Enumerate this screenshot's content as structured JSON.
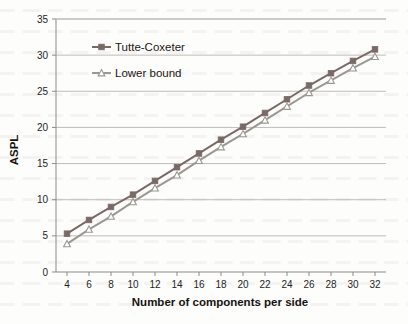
{
  "chart_data": {
    "type": "line",
    "title": "",
    "xlabel": "Number of components per side",
    "ylabel": "ASPL",
    "x": [
      4,
      6,
      8,
      10,
      12,
      14,
      16,
      18,
      20,
      22,
      24,
      26,
      28,
      30,
      32
    ],
    "xlim": [
      3,
      33
    ],
    "ylim": [
      0,
      35
    ],
    "xticks": [
      4,
      6,
      8,
      10,
      12,
      14,
      16,
      18,
      20,
      22,
      24,
      26,
      28,
      30,
      32
    ],
    "yticks": [
      0,
      5,
      10,
      15,
      20,
      25,
      30,
      35
    ],
    "grid": "horizontal",
    "legend_position": "upper-left-inside",
    "series": [
      {
        "name": "Tutte-Coxeter",
        "marker": "filled-square",
        "color": "#7a6a66",
        "values": [
          5.3,
          7.2,
          9.0,
          10.7,
          12.6,
          14.5,
          16.4,
          18.3,
          20.1,
          22.0,
          23.9,
          25.8,
          27.5,
          29.2,
          30.8
        ]
      },
      {
        "name": "Lower bound",
        "marker": "open-triangle",
        "color": "#9b9893",
        "values": [
          3.9,
          5.9,
          7.7,
          9.7,
          11.6,
          13.4,
          15.4,
          17.3,
          19.1,
          21.0,
          22.9,
          24.8,
          26.5,
          28.2,
          29.8
        ]
      }
    ]
  },
  "legend": {
    "entries": [
      {
        "label": "Tutte-Coxeter"
      },
      {
        "label": "Lower bound"
      }
    ]
  },
  "axes": {
    "y_title": "ASPL",
    "x_title": "Number of components per side"
  }
}
